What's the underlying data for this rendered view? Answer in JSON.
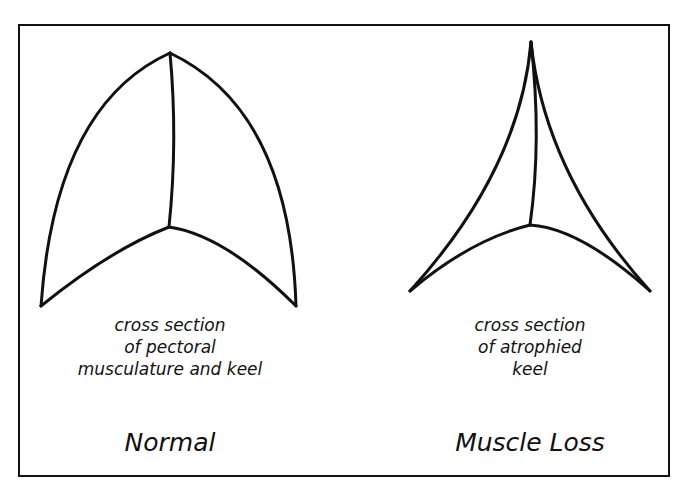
{
  "diagram": {
    "panels": [
      {
        "id": "normal",
        "caption_lines": [
          "cross section",
          "of pectoral",
          "musculature and keel"
        ],
        "title": "Normal"
      },
      {
        "id": "muscle-loss",
        "caption_lines": [
          "cross section",
          "of atrophied",
          "keel"
        ],
        "title": "Muscle Loss"
      }
    ],
    "line_color": "#111111",
    "background": "#ffffff"
  }
}
